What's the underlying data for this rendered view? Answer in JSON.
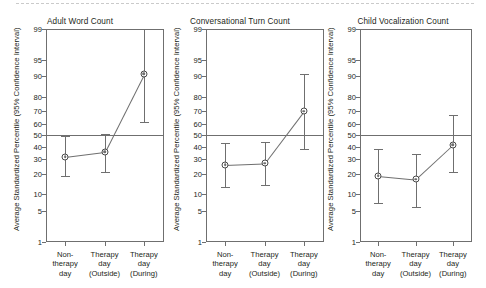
{
  "figure": {
    "caption_rule": "page-separator",
    "background": "#ffffff",
    "line_color": "#6f6f6f",
    "text_color": "#231f20"
  },
  "axis": {
    "ylabel": "Average Standardized Percentile (95% Confidence Interval)",
    "yticks": [
      1,
      5,
      10,
      20,
      30,
      40,
      50,
      60,
      70,
      80,
      90,
      95,
      99
    ],
    "ytick_labels": [
      "1",
      "5",
      "10",
      "20",
      "30",
      "40",
      "50",
      "60",
      "70",
      "80",
      "90",
      "95",
      "99"
    ],
    "yscale": "normal-probability (probit)",
    "ylim": [
      1,
      99
    ],
    "reference_line": 50,
    "categories": [
      {
        "line1": "Non-",
        "line2": "therapy",
        "line3": "day"
      },
      {
        "line1": "Therapy",
        "line2": "day",
        "line3": "(Outside)"
      },
      {
        "line1": "Therapy",
        "line2": "day",
        "line3": "(During)"
      }
    ]
  },
  "chart_data": [
    {
      "type": "line",
      "title": "Adult Word Count",
      "xlabel": "",
      "ylabel": "Average Standardized Percentile (95% Confidence Interval)",
      "ylim": [
        1,
        99
      ],
      "yscale": "probit",
      "grid": false,
      "legend": "none",
      "reference_line": 50,
      "categories": [
        "Non-therapy day",
        "Therapy day (Outside)",
        "Therapy day (During)"
      ],
      "values": [
        32,
        36,
        91
      ],
      "ci_lower": [
        19,
        21,
        61
      ],
      "ci_upper": [
        49,
        51,
        99
      ]
    },
    {
      "type": "line",
      "title": "Conversational Turn Count",
      "xlabel": "",
      "ylabel": "Average Standardized Percentile (95% Confidence Interval)",
      "ylim": [
        1,
        99
      ],
      "yscale": "probit",
      "grid": false,
      "legend": "none",
      "reference_line": 50,
      "categories": [
        "Non-therapy day",
        "Therapy day (Outside)",
        "Therapy day (During)"
      ],
      "values": [
        26,
        27,
        70
      ],
      "ci_lower": [
        13,
        14,
        38
      ],
      "ci_upper": [
        43,
        44,
        91
      ]
    },
    {
      "type": "line",
      "title": "Child Vocalization Count",
      "xlabel": "",
      "ylabel": "Average Standardized Percentile (95% Confidence Interval)",
      "ylim": [
        1,
        99
      ],
      "yscale": "probit",
      "grid": false,
      "legend": "none",
      "reference_line": 50,
      "categories": [
        "Non-therapy day",
        "Therapy day (Outside)",
        "Therapy day (During)"
      ],
      "values": [
        19,
        17,
        42
      ],
      "ci_lower": [
        7,
        6,
        21
      ],
      "ci_upper": [
        38,
        34,
        67
      ]
    }
  ]
}
